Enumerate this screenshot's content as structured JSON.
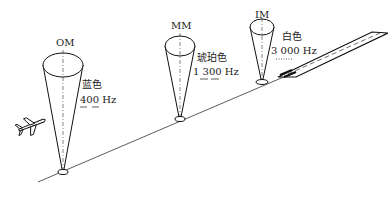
{
  "diagram": {
    "markers": [
      {
        "id": "OM",
        "label": "OM",
        "color_name": "蓝色",
        "frequency": "400 Hz",
        "code": "— —"
      },
      {
        "id": "MM",
        "label": "MM",
        "color_name": "琥珀色",
        "frequency": "1 300 Hz",
        "code": "·— ·—"
      },
      {
        "id": "IM",
        "label": "IM",
        "color_name": "白色",
        "frequency": "3 000 Hz",
        "code": "······"
      }
    ],
    "elements": [
      "aircraft",
      "ground-track-line",
      "runway"
    ]
  }
}
